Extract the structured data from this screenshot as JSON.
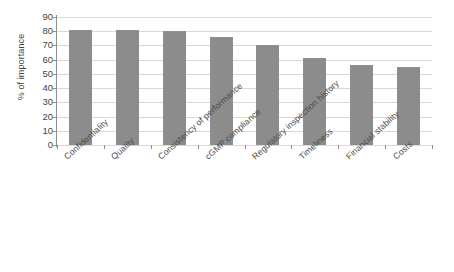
{
  "chart_data": {
    "type": "bar",
    "title": "",
    "xlabel": "",
    "ylabel": "% of importance",
    "ylim": [
      0,
      90
    ],
    "ytick_step": 10,
    "yticks": [
      0,
      10,
      20,
      30,
      40,
      50,
      60,
      70,
      80,
      90
    ],
    "grid": true,
    "legend": "none",
    "bar_color": "#8c8c8c",
    "axis_color": "#8d8d8d",
    "gridline_color": "#d8d8d8",
    "categories": [
      "Confidentiality",
      "Quality",
      "Consistency of performance",
      "cGMP compliance",
      "Regulatory inspection history",
      "Timeliness",
      "Financial stability",
      "Costs"
    ],
    "values": [
      81,
      81,
      80,
      76,
      70,
      61,
      56,
      55
    ]
  }
}
